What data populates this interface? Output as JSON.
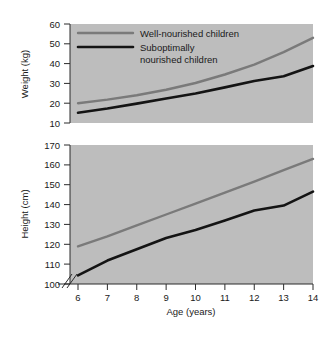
{
  "figure": {
    "background_color": "#ffffff",
    "panel_color": "#bdbdbd",
    "axis_color": "#2b2b2b"
  },
  "legend": {
    "position": "top-left-of-weight-panel",
    "entries": [
      {
        "label": "Well-nourished children",
        "color": "#7a7a7a"
      },
      {
        "label": "Suboptimally",
        "label2": "nourished children",
        "color": "#141414"
      }
    ]
  },
  "chart_data": [
    {
      "type": "line",
      "title": "",
      "panel": "weight",
      "xlabel": "",
      "ylabel": "Weight (kg)",
      "x": [
        6,
        7,
        8,
        9,
        10,
        11,
        12,
        13,
        14
      ],
      "xlim": [
        6,
        14
      ],
      "ylim": [
        10,
        60
      ],
      "xticks": [
        6,
        7,
        8,
        9,
        10,
        11,
        12,
        13,
        14
      ],
      "yticks": [
        10,
        20,
        30,
        40,
        50,
        60
      ],
      "grid": false,
      "axis_break_y": true,
      "series": [
        {
          "name": "Well-nourished children",
          "color": "#7a7a7a",
          "values": [
            20.0,
            21.8,
            24.0,
            26.8,
            30.2,
            34.5,
            39.5,
            45.8,
            53.0
          ]
        },
        {
          "name": "Suboptimally nourished children",
          "color": "#141414",
          "values": [
            15.2,
            17.3,
            19.8,
            22.4,
            24.9,
            28.0,
            31.2,
            33.6,
            38.8
          ]
        }
      ]
    },
    {
      "type": "line",
      "title": "",
      "panel": "height",
      "xlabel": "Age (years)",
      "ylabel": "Height (cm)",
      "x": [
        6,
        7,
        8,
        9,
        10,
        11,
        12,
        13,
        14
      ],
      "xlim": [
        6,
        14
      ],
      "ylim": [
        100,
        170
      ],
      "xticks": [
        6,
        7,
        8,
        9,
        10,
        11,
        12,
        13,
        14
      ],
      "yticks": [
        100,
        110,
        120,
        130,
        140,
        150,
        160,
        170
      ],
      "grid": false,
      "axis_break_y": true,
      "series": [
        {
          "name": "Well-nourished children",
          "color": "#7a7a7a",
          "values": [
            119.0,
            124.0,
            129.5,
            135.0,
            140.5,
            146.0,
            151.5,
            157.3,
            163.0
          ]
        },
        {
          "name": "Suboptimally nourished children",
          "color": "#141414",
          "values": [
            104.3,
            111.8,
            117.5,
            123.2,
            127.2,
            132.0,
            137.0,
            139.5,
            146.5
          ]
        }
      ]
    }
  ],
  "axis_titles": {
    "weight_y": "Weight (kg)",
    "height_y": "Height (cm)",
    "x": "Age (years)"
  },
  "tick_labels": {
    "weight_y": [
      "60",
      "50",
      "40",
      "30",
      "20",
      "10"
    ],
    "height_y": [
      "170",
      "160",
      "150",
      "140",
      "130",
      "120",
      "110",
      "100"
    ],
    "x": [
      "6",
      "7",
      "8",
      "9",
      "10",
      "11",
      "12",
      "13",
      "14"
    ]
  }
}
